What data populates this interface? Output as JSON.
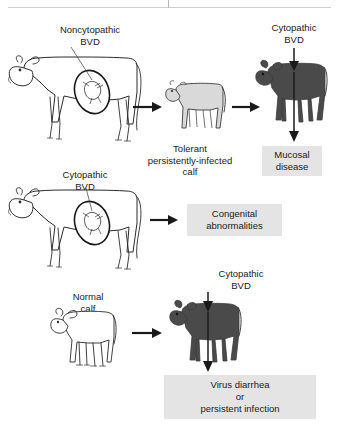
{
  "figure": {
    "title_rule": true
  },
  "rows": [
    {
      "id": "row-persistent-infection",
      "source_label": "Noncytopathic\nBVD",
      "animal_source": "pregnant-cow",
      "intermediate_label": "Tolerant\npersistently-infected\ncalf",
      "intermediate_animal": "gray-calf",
      "challenge_label": "Cytopathic\nBVD",
      "challenge_animal": "dark-calf",
      "outcome_label": "Mucosal\ndisease"
    },
    {
      "id": "row-congenital",
      "source_label": "Cytopathic\nBVD",
      "animal_source": "pregnant-cow",
      "outcome_label": "Congenital\nabnormalities"
    },
    {
      "id": "row-normal-calf",
      "source_label": "Normal\ncalf",
      "animal_source": "white-calf",
      "challenge_label": "Cytopathic\nBVD",
      "challenge_animal": "dark-calf",
      "outcome_label": "Virus diarrhea\nor\npersistent infection"
    }
  ],
  "colors": {
    "outcome_box_bg": "#e4e4e4",
    "text": "#1a1a1a",
    "dark_animal": "#4a4a4a",
    "gray_animal": "#d9d9d9",
    "outline": "#2b2b2b"
  }
}
